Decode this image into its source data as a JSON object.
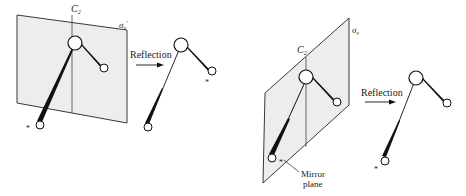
{
  "colors": {
    "plane_fill": "#ededed",
    "stroke": "#222222",
    "background": "#ffffff"
  },
  "left_panel": {
    "axis_label": "C",
    "axis_subscript": "2",
    "plane_label": "σ",
    "plane_subscript": "v",
    "plane_prime": "′",
    "arrow_label": "Reflection",
    "marker": "*"
  },
  "right_panel": {
    "axis_label": "C",
    "axis_subscript": "2",
    "plane_label": "σ",
    "plane_subscript": "v",
    "arrow_label": "Reflection",
    "mirror_label_line1": "Mirror",
    "mirror_label_line2": "plane",
    "marker": "*"
  }
}
